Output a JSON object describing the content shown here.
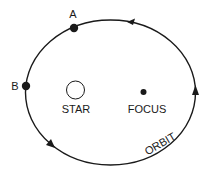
{
  "diagram": {
    "title": "",
    "labels": {
      "point_a": "A",
      "point_b": "B",
      "star": "STAR",
      "focus": "FOCUS",
      "orbit": "ORBIT"
    },
    "orbit": {
      "shape": "ellipse",
      "direction": "counter-clockwise",
      "arrows": 4
    },
    "colors": {
      "line": "#1a1a1a",
      "background": "#ffffff",
      "star_fill": "#ffffff"
    }
  }
}
